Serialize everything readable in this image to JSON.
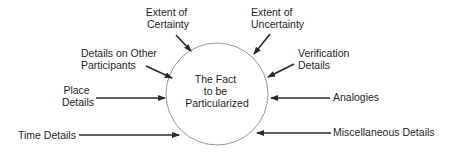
{
  "diagram": {
    "center": {
      "lines": [
        "The Fact",
        "to be",
        "Particularized"
      ],
      "cx": 217,
      "cy": 94,
      "r": 51,
      "stroke": "#8a8a8a"
    },
    "colors": {
      "text": "#1e1e1e",
      "arrow": "#2a2a2a",
      "circle": "#8a8a8a",
      "background": "#ffffff"
    },
    "labels": [
      {
        "id": "extent-of-certainty",
        "lines": [
          "Extent of",
          "Certainty"
        ],
        "anchor": "middle",
        "x": 168,
        "y": 18
      },
      {
        "id": "extent-of-uncertainty",
        "lines": [
          "Extent of",
          "Uncertainty"
        ],
        "anchor": "start",
        "x": 251,
        "y": 18
      },
      {
        "id": "details-on-other-participants",
        "lines": [
          "Details on Other",
          "Participants"
        ],
        "anchor": "start",
        "x": 81,
        "y": 57
      },
      {
        "id": "verification-details",
        "lines": [
          "Verification",
          "Details"
        ],
        "anchor": "start",
        "x": 298,
        "y": 57
      },
      {
        "id": "place-details",
        "lines": [
          "Place",
          "Details"
        ],
        "anchor": "middle",
        "x": 78,
        "y": 93
      },
      {
        "id": "analogies",
        "lines": [
          "Analogies"
        ],
        "anchor": "start",
        "x": 333,
        "y": 100
      },
      {
        "id": "time-details",
        "lines": [
          "Time Details"
        ],
        "anchor": "start",
        "x": 18,
        "y": 139
      },
      {
        "id": "miscellaneous-details",
        "lines": [
          "Miscellaneous Details"
        ],
        "anchor": "start",
        "x": 333,
        "y": 136
      }
    ],
    "arrows": [
      {
        "id": "arrow-certainty",
        "x1": 176,
        "y1": 35,
        "x2": 191,
        "y2": 51
      },
      {
        "id": "arrow-uncertainty",
        "x1": 270,
        "y1": 34,
        "x2": 254,
        "y2": 54
      },
      {
        "id": "arrow-participants",
        "x1": 146,
        "y1": 66,
        "x2": 172,
        "y2": 78
      },
      {
        "id": "arrow-verification",
        "x1": 294,
        "y1": 64,
        "x2": 268,
        "y2": 77
      },
      {
        "id": "arrow-place",
        "x1": 96,
        "y1": 98,
        "x2": 165,
        "y2": 98
      },
      {
        "id": "arrow-analogies",
        "x1": 330,
        "y1": 98,
        "x2": 271,
        "y2": 98
      },
      {
        "id": "arrow-time",
        "x1": 79,
        "y1": 135,
        "x2": 179,
        "y2": 135
      },
      {
        "id": "arrow-miscellaneous",
        "x1": 331,
        "y1": 133,
        "x2": 257,
        "y2": 133
      }
    ]
  }
}
